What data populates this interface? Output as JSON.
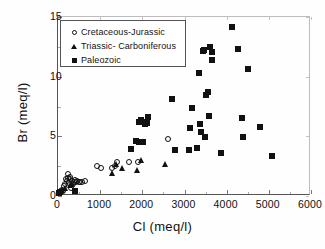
{
  "chart_data": {
    "type": "scatter",
    "title": "",
    "xlabel": "Cl  (meq/l)",
    "ylabel": "Br  (meq/l)",
    "xlim": [
      0,
      6000
    ],
    "ylim": [
      0,
      15
    ],
    "xticks": [
      0,
      1000,
      2000,
      3000,
      4000,
      5000,
      6000
    ],
    "yticks": [
      0,
      5,
      10,
      15
    ],
    "grid": false,
    "legend_position": "upper-left",
    "series": [
      {
        "name": "Cretaceous-Jurassic",
        "marker": "open-circle",
        "color": "#111111",
        "points": [
          [
            60,
            0.25
          ],
          [
            95,
            0.3
          ],
          [
            130,
            0.45
          ],
          [
            150,
            0.35
          ],
          [
            170,
            0.75
          ],
          [
            200,
            0.95
          ],
          [
            215,
            1.35
          ],
          [
            240,
            1.15
          ],
          [
            250,
            1.75
          ],
          [
            270,
            1.45
          ],
          [
            285,
            1.0
          ],
          [
            300,
            1.3
          ],
          [
            320,
            1.55
          ],
          [
            330,
            0.6
          ],
          [
            350,
            1.2
          ],
          [
            370,
            0.95
          ],
          [
            395,
            1.1
          ],
          [
            420,
            1.25
          ],
          [
            455,
            1.05
          ],
          [
            480,
            1.15
          ],
          [
            520,
            1.05
          ],
          [
            555,
            1.1
          ],
          [
            600,
            1.1
          ],
          [
            660,
            1.15
          ],
          [
            960,
            2.4
          ],
          [
            1040,
            2.25
          ],
          [
            1300,
            2.25
          ],
          [
            1380,
            2.4
          ],
          [
            1430,
            2.75
          ],
          [
            1700,
            2.75
          ],
          [
            1930,
            2.8
          ],
          [
            2640,
            4.7
          ]
        ]
      },
      {
        "name": "Triassic- Carboniferous",
        "marker": "filled-triangle",
        "color": "#111111",
        "points": [
          [
            130,
            0.4
          ],
          [
            200,
            0.55
          ],
          [
            300,
            0.8
          ],
          [
            360,
            0.9
          ],
          [
            1310,
            1.85
          ],
          [
            1400,
            2.6
          ],
          [
            1530,
            2.25
          ],
          [
            1900,
            2.1
          ],
          [
            2000,
            2.9
          ],
          [
            2560,
            2.6
          ]
        ]
      },
      {
        "name": "Paleozoic",
        "marker": "filled-square",
        "color": "#111111",
        "points": [
          [
            40,
            0.2
          ],
          [
            80,
            0.25
          ],
          [
            420,
            0.35
          ],
          [
            1760,
            3.85
          ],
          [
            1880,
            4.55
          ],
          [
            1950,
            4.45
          ],
          [
            2040,
            4.45
          ],
          [
            1950,
            6.1
          ],
          [
            1990,
            6.25
          ],
          [
            2060,
            6.15
          ],
          [
            2090,
            5.95
          ],
          [
            2130,
            6.0
          ],
          [
            2150,
            6.5
          ],
          [
            2730,
            8.05
          ],
          [
            2790,
            3.8
          ],
          [
            3120,
            3.75
          ],
          [
            3160,
            5.6
          ],
          [
            3200,
            7.25
          ],
          [
            3330,
            3.95
          ],
          [
            3370,
            10.25
          ],
          [
            3380,
            5.95
          ],
          [
            3420,
            5.25
          ],
          [
            3470,
            12.1
          ],
          [
            3490,
            12.15
          ],
          [
            3520,
            4.85
          ],
          [
            3540,
            8.4
          ],
          [
            3570,
            8.6
          ],
          [
            3600,
            6.65
          ],
          [
            3620,
            12.4
          ],
          [
            3670,
            12.0
          ],
          [
            3680,
            11.35
          ],
          [
            3880,
            3.5
          ],
          [
            4150,
            14.1
          ],
          [
            4290,
            12.2
          ],
          [
            4390,
            6.45
          ],
          [
            4410,
            4.85
          ],
          [
            4520,
            10.6
          ],
          [
            4810,
            5.7
          ],
          [
            5110,
            3.3
          ]
        ]
      }
    ]
  },
  "legend": {
    "items": [
      {
        "label": "Cretaceous-Jurassic",
        "marker": "open-circle"
      },
      {
        "label": "Triassic- Carboniferous",
        "marker": "filled-triangle"
      },
      {
        "label": "Paleozoic",
        "marker": "filled-square"
      }
    ]
  }
}
